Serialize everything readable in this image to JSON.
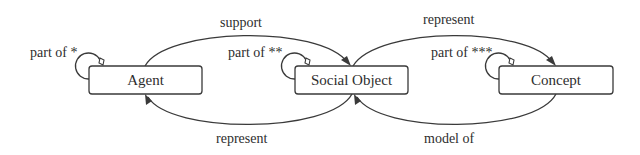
{
  "diagram": {
    "nodes": [
      {
        "id": "agent",
        "label": "Agent",
        "x": 89,
        "y": 66,
        "w": 113,
        "h": 28
      },
      {
        "id": "social_object",
        "label": "Social Object",
        "x": 295,
        "y": 66,
        "w": 113,
        "h": 28
      },
      {
        "id": "concept",
        "label": "Concept",
        "x": 499,
        "y": 66,
        "w": 114,
        "h": 28
      }
    ],
    "edges": [
      {
        "id": "support",
        "from": "Agent",
        "to": "Social Object",
        "label": "support"
      },
      {
        "id": "represent_top",
        "from": "Social Object",
        "to": "Concept",
        "label": "represent"
      },
      {
        "id": "represent_bottom",
        "from": "Social Object",
        "to": "Agent",
        "label": "represent"
      },
      {
        "id": "model_of",
        "from": "Concept",
        "to": "Social Object",
        "label": "model of"
      }
    ],
    "self_loops": [
      {
        "node": "Agent",
        "label": "part of *"
      },
      {
        "node": "Social Object",
        "label": "part of **"
      },
      {
        "node": "Concept",
        "label": "part of ***"
      }
    ],
    "colors": {
      "stroke": "#3a3a3a",
      "text": "#2e2e2e",
      "background": "#ffffff"
    }
  }
}
